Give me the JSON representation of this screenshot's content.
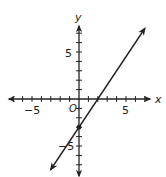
{
  "chart_data": {
    "type": "line",
    "title": "",
    "xlabel": "x",
    "ylabel": "y",
    "origin_label": "O",
    "tick_labels": {
      "x": [
        "−5",
        "5"
      ],
      "y": [
        "5",
        "−5"
      ]
    },
    "xlim": [
      -7.5,
      7.5
    ],
    "ylim": [
      -7.5,
      7.5
    ],
    "tick_step": 1,
    "grid": false,
    "series": [
      {
        "name": "line",
        "equation": "y = 1.5x - 3",
        "slope": 1.5,
        "y_intercept": -3,
        "x_intercept": 2,
        "x": [
          -3,
          7
        ],
        "y": [
          -7.5,
          7.5
        ],
        "arrows_both_ends": true
      }
    ],
    "points": [
      {
        "x": 0,
        "y": -3,
        "label": ""
      }
    ]
  },
  "colors": {
    "axis": "#222222",
    "line": "#222222",
    "background": "#ffffff"
  }
}
